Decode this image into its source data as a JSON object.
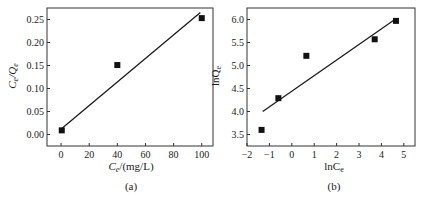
{
  "chart_data": [
    {
      "type": "scatter",
      "panel": "(a)",
      "title": "",
      "xlabel": "Ce/(mg/L)",
      "xlabel_main": "C",
      "xlabel_sub": "e",
      "xlabel_rest": "/(mg/L)",
      "ylabel": "Ce/Qe",
      "ylabel_c": "C",
      "ylabel_sub1": "e",
      "ylabel_q": "/Q",
      "ylabel_sub2": "e",
      "xlim": [
        -10,
        108
      ],
      "ylim": [
        -0.025,
        0.275
      ],
      "xticks": [
        "0",
        "20",
        "40",
        "60",
        "80",
        "100"
      ],
      "xtick_values": [
        0,
        20,
        40,
        60,
        80,
        100
      ],
      "yticks": [
        "0.00",
        "0.05",
        "0.10",
        "0.15",
        "0.20",
        "0.25"
      ],
      "ytick_values": [
        0.0,
        0.05,
        0.1,
        0.15,
        0.2,
        0.25
      ],
      "grid": false,
      "legend": null,
      "series": [
        {
          "name": "data",
          "marker": "square",
          "x": [
            0.5,
            40,
            100
          ],
          "y": [
            0.009,
            0.151,
            0.253
          ]
        },
        {
          "name": "linear fit",
          "style": "line",
          "x": [
            0.5,
            99
          ],
          "y": [
            0.013,
            0.265
          ]
        }
      ]
    },
    {
      "type": "scatter",
      "panel": "(b)",
      "title": "",
      "xlabel": "lnCe",
      "xlabel_main": "lnC",
      "xlabel_sub": "e",
      "ylabel": "lnQe",
      "ylabel_main": "lnQ",
      "ylabel_sub": "e",
      "xlim": [
        -2,
        5.5
      ],
      "ylim": [
        3.25,
        6.25
      ],
      "xticks": [
        "−2",
        "−1",
        "0",
        "1",
        "2",
        "3",
        "4",
        "5"
      ],
      "xtick_values": [
        -2,
        -1,
        0,
        1,
        2,
        3,
        4,
        5
      ],
      "yticks": [
        "3.5",
        "4.0",
        "4.5",
        "5.0",
        "5.5",
        "6.0"
      ],
      "ytick_values": [
        3.5,
        4.0,
        4.5,
        5.0,
        5.5,
        6.0
      ],
      "grid": false,
      "legend": null,
      "series": [
        {
          "name": "data",
          "marker": "square",
          "x": [
            -1.35,
            -0.6,
            0.65,
            3.7,
            4.65
          ],
          "y": [
            3.6,
            4.29,
            5.21,
            5.57,
            5.97
          ]
        },
        {
          "name": "linear fit",
          "style": "line",
          "x": [
            -1.3,
            4.6
          ],
          "y": [
            4.0,
            6.0
          ]
        }
      ]
    }
  ]
}
